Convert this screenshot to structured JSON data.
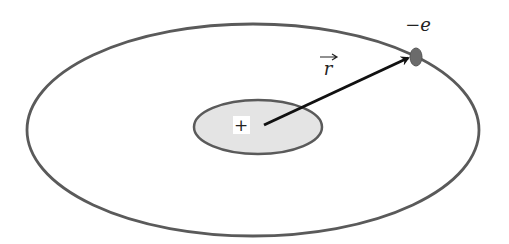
{
  "diagram": {
    "type": "atom-orbit",
    "labels": {
      "electron": "−e",
      "vector": "r",
      "nucleus": "+"
    },
    "colors": {
      "orbit_stroke": "#5a5a5a",
      "nucleus_fill": "#e4e4e4",
      "electron_fill": "#6b6b6b",
      "arrow": "#111111",
      "background": "#ffffff"
    }
  }
}
